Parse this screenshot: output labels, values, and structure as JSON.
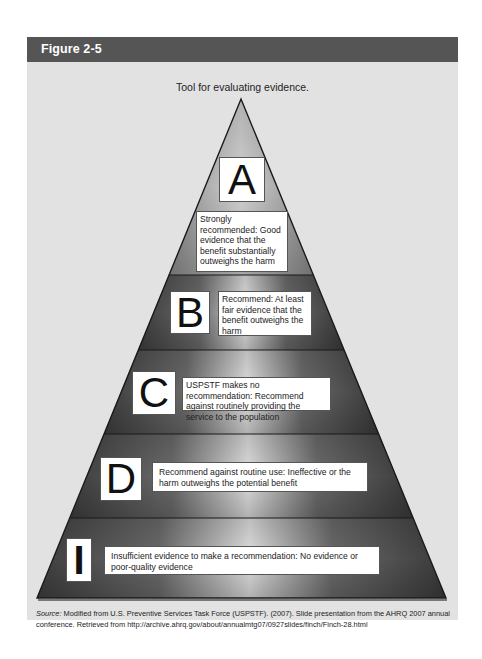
{
  "figure": {
    "label": "Figure 2-5",
    "caption": "Tool for evaluating evidence.",
    "source_label": "Source:",
    "source_text": " Modified from U.S. Preventive Services Task Force (USPSTF). (2007). Slide presentation from the AHRQ 2007 annual conference. Retrieved from http://archive.ahrq.gov/about/annualmtg07/0927slides/finch/Finch-28.html"
  },
  "pyramid": {
    "levels": [
      {
        "grade": "A",
        "description": "Strongly recommended: Good evidence that the benefit substantially outweighs the harm"
      },
      {
        "grade": "B",
        "description": "Recommend: At least fair evidence that the benefit outweighs the harm"
      },
      {
        "grade": "C",
        "description": "USPSTF makes no recommendation: Recommend against routinely providing the service to the population"
      },
      {
        "grade": "D",
        "description": "Recommend against routine use: Ineffective or the harm outweighs the potential benefit"
      },
      {
        "grade": "I",
        "description": "Insufficient evidence to make a recommendation: No evidence or poor-quality evidence"
      }
    ]
  },
  "colors": {
    "header_bg": "#555555",
    "frame_bg": "#e2e2e2",
    "band_dark": "#3c3c3c",
    "band_light": "#d8d8d8",
    "outline": "#1a1a1a"
  }
}
